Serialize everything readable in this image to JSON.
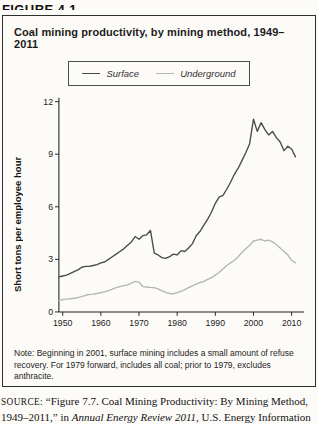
{
  "figure_label": "FIGURE 4.1",
  "box": {
    "title": "Coal mining productivity, by mining method, 1949–2011",
    "note": "Note: Beginning in 2001, surface mining includes a small amount of refuse recovery. For 1979 forward, includes all coal; prior to 1979, excludes anthracite."
  },
  "source": {
    "label": "SOURCE:",
    "text_before_italic": " “Figure 7.7. Coal Mining Productivity: By Mining Method, 1949–2011,” in ",
    "italic": "Annual Energy Review 2011",
    "text_after_italic": ", U.S. Energy Information Administration, September 27, 2012, http://www.eia.gov/totalenergy/"
  },
  "chart_data": {
    "type": "line",
    "title": "Coal mining productivity, by mining method, 1949–2011",
    "xlabel": "",
    "ylabel": "Short tons per employee hour",
    "xlim": [
      1949,
      2012
    ],
    "ylim": [
      0,
      12
    ],
    "yticks": [
      0,
      3,
      6,
      9,
      12
    ],
    "xticks": [
      1950,
      1960,
      1970,
      1980,
      1990,
      2000,
      2010
    ],
    "grid": false,
    "legend_position": "top-center",
    "axis_color": "#222222",
    "x": [
      1949,
      1950,
      1951,
      1952,
      1953,
      1954,
      1955,
      1956,
      1957,
      1958,
      1959,
      1960,
      1961,
      1962,
      1963,
      1964,
      1965,
      1966,
      1967,
      1968,
      1969,
      1970,
      1971,
      1972,
      1973,
      1974,
      1975,
      1976,
      1977,
      1978,
      1979,
      1980,
      1981,
      1982,
      1983,
      1984,
      1985,
      1986,
      1987,
      1988,
      1989,
      1990,
      1991,
      1992,
      1993,
      1994,
      1995,
      1996,
      1997,
      1998,
      1999,
      2000,
      2001,
      2002,
      2003,
      2004,
      2005,
      2006,
      2007,
      2008,
      2009,
      2010,
      2011
    ],
    "series": [
      {
        "name": "Surface",
        "color": "#4a4a4a",
        "values": [
          2.0,
          2.05,
          2.1,
          2.2,
          2.3,
          2.4,
          2.55,
          2.6,
          2.6,
          2.65,
          2.7,
          2.8,
          2.85,
          3.0,
          3.15,
          3.3,
          3.45,
          3.6,
          3.8,
          4.0,
          4.3,
          4.15,
          4.35,
          4.4,
          4.65,
          3.35,
          3.25,
          3.1,
          3.05,
          3.15,
          3.3,
          3.25,
          3.5,
          3.45,
          3.65,
          3.9,
          4.35,
          4.6,
          4.95,
          5.3,
          5.7,
          6.2,
          6.55,
          6.65,
          7.0,
          7.4,
          7.85,
          8.2,
          8.65,
          9.1,
          9.6,
          11.0,
          10.3,
          10.8,
          10.4,
          10.1,
          10.3,
          9.95,
          9.7,
          9.2,
          9.45,
          9.3,
          8.85
        ]
      },
      {
        "name": "Underground",
        "color": "#b5b5b5",
        "values": [
          0.65,
          0.7,
          0.73,
          0.75,
          0.78,
          0.82,
          0.88,
          0.95,
          1.0,
          1.02,
          1.05,
          1.1,
          1.15,
          1.22,
          1.3,
          1.38,
          1.45,
          1.5,
          1.55,
          1.65,
          1.75,
          1.7,
          1.45,
          1.42,
          1.4,
          1.38,
          1.32,
          1.2,
          1.12,
          1.05,
          1.03,
          1.1,
          1.18,
          1.28,
          1.38,
          1.48,
          1.58,
          1.68,
          1.75,
          1.85,
          1.95,
          2.1,
          2.25,
          2.45,
          2.65,
          2.8,
          2.95,
          3.15,
          3.4,
          3.6,
          3.8,
          4.05,
          4.1,
          4.15,
          4.05,
          4.1,
          4.0,
          3.85,
          3.65,
          3.45,
          3.25,
          2.95,
          2.8
        ]
      }
    ]
  }
}
